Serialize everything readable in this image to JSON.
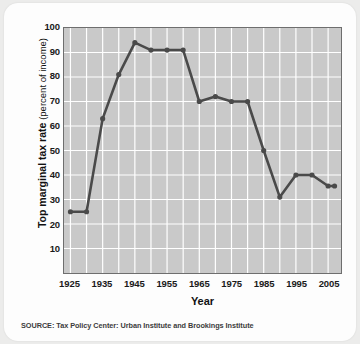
{
  "chart_data": {
    "type": "line",
    "title": "",
    "xlabel": "Year",
    "ylabel": "Top marginal tax rate (percent of income)",
    "ylabel_strong": "Top marginal tax rate",
    "ylabel_light": "(percent of income)",
    "xlim": [
      1923,
      2009
    ],
    "ylim": [
      0,
      100
    ],
    "ytick_step": 10,
    "xtick_step": 10,
    "grid": true,
    "grid_color": "#ffffff",
    "plot_bg": "#c9c9c9",
    "series_color": "#4a4a4a",
    "legend": "none",
    "yticks": [
      100,
      90,
      80,
      70,
      60,
      50,
      40,
      30,
      20,
      10
    ],
    "xticks": [
      1925,
      1935,
      1945,
      1955,
      1965,
      1975,
      1985,
      1995,
      2005
    ],
    "x": [
      1925,
      1930,
      1935,
      1940,
      1945,
      1950,
      1955,
      1960,
      1965,
      1970,
      1975,
      1980,
      1985,
      1990,
      1995,
      2000,
      2005,
      2007
    ],
    "values": [
      25,
      25,
      63,
      81,
      94,
      91,
      91,
      91,
      70,
      72,
      70,
      70,
      50,
      31,
      40,
      40,
      35.5,
      35.5
    ],
    "series": [
      {
        "name": "Top marginal tax rate",
        "values": [
          25,
          25,
          63,
          81,
          94,
          91,
          91,
          91,
          70,
          72,
          70,
          70,
          50,
          31,
          40,
          40,
          35.5,
          35.5
        ]
      }
    ],
    "source": "SOURCE: Tax Policy Center: Urban Institute and Brookings Institute"
  }
}
